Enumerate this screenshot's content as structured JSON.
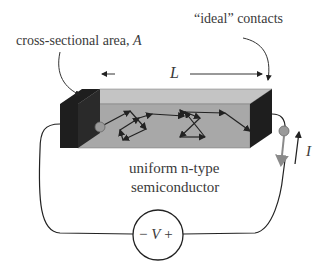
{
  "labels": {
    "contacts": "“ideal” contacts",
    "area": "cross-sectional area, ",
    "area_var": "A",
    "length": "L",
    "material_line1": "uniform n-type",
    "material_line2": "semiconductor",
    "current": "I",
    "source_minus": "−",
    "source_var": "V",
    "source_plus": "+"
  },
  "colors": {
    "contact": "#1e1e1e",
    "bar_front": "#a8a8a8",
    "bar_top": "#c4c4c4",
    "wire": "#222222",
    "current_arrow": "#8a8a8a",
    "node": "#9a9a9a"
  }
}
